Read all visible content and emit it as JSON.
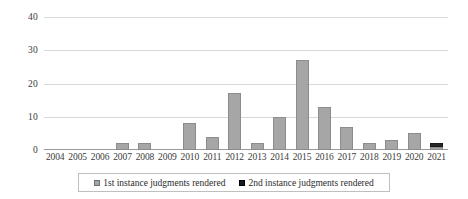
{
  "chart_data": {
    "type": "bar",
    "title": "",
    "subtitle": "",
    "xlabel": "",
    "ylabel": "",
    "ylim": [
      0,
      40
    ],
    "yticks": [
      0,
      10,
      20,
      30,
      40
    ],
    "grid": true,
    "stacked": true,
    "legend_position": "bottom",
    "categories": [
      "2004",
      "2005",
      "2006",
      "2007",
      "2008",
      "2009",
      "2010",
      "2011",
      "2012",
      "2013",
      "2014",
      "2015",
      "2016",
      "2017",
      "2018",
      "2019",
      "2020",
      "2021"
    ],
    "series": [
      {
        "name": "1st instance judgments rendered",
        "color": "#a6a6a6",
        "values": [
          0,
          0,
          0,
          2,
          2,
          0,
          8,
          4,
          17,
          2,
          10,
          27,
          13,
          7,
          2,
          3,
          5,
          1
        ]
      },
      {
        "name": "2nd instance judgments rendered",
        "color": "#262626",
        "values": [
          0,
          0,
          0,
          0,
          0,
          0,
          0,
          0,
          0,
          0,
          0,
          0,
          0,
          0,
          0,
          0,
          0,
          1
        ]
      }
    ]
  },
  "legend": {
    "items": [
      {
        "label": "1st instance judgments rendered"
      },
      {
        "label": "2nd instance judgments rendered"
      }
    ]
  },
  "axes": {
    "y_tick_labels": [
      "0",
      "10",
      "20",
      "30",
      "40"
    ],
    "x_tick_labels": [
      "2004",
      "2005",
      "2006",
      "2007",
      "2008",
      "2009",
      "2010",
      "2011",
      "2012",
      "2013",
      "2014",
      "2015",
      "2016",
      "2017",
      "2018",
      "2019",
      "2020",
      "2021"
    ]
  }
}
